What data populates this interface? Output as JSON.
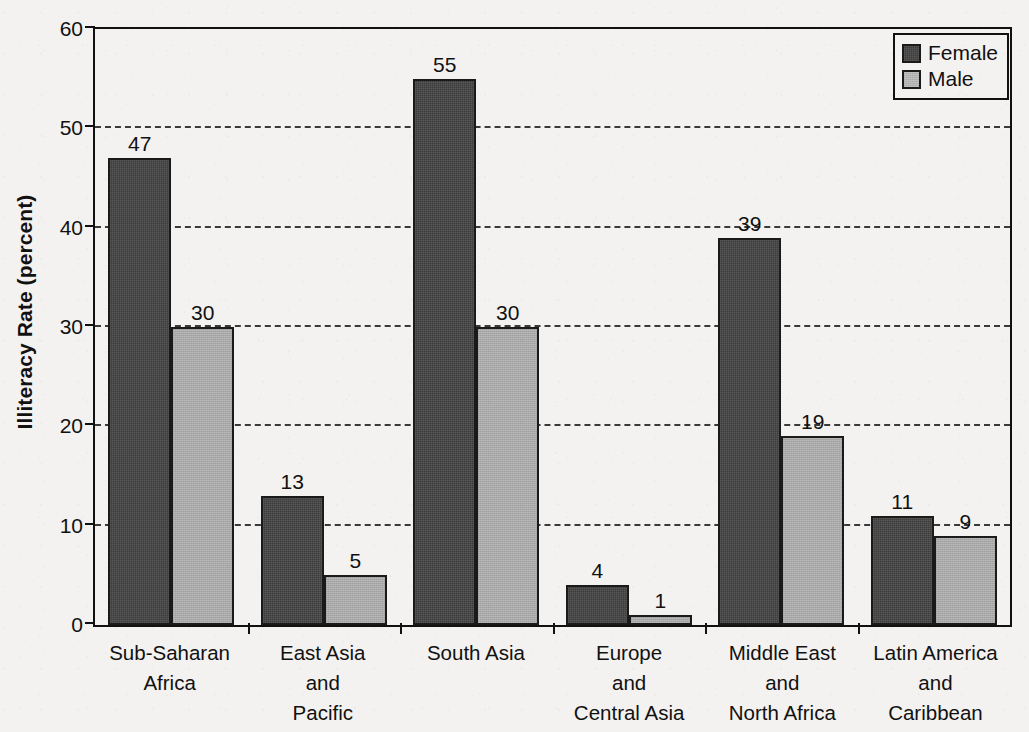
{
  "chart_data": {
    "type": "bar",
    "title": "",
    "xlabel": "",
    "ylabel": "Illiteracy Rate (percent)",
    "ylim": [
      0,
      60
    ],
    "ytick_labels": [
      "0",
      "10",
      "20",
      "30",
      "40",
      "50",
      "60"
    ],
    "yticks": [
      0,
      10,
      20,
      30,
      40,
      50,
      60
    ],
    "grid": "horizontal-dashed",
    "legend_position": "top-right",
    "categories": [
      "Sub-Saharan\nAfrica",
      "East Asia\nand\nPacific",
      "South Asia",
      "Europe\nand\nCentral Asia",
      "Middle East\nand\nNorth Africa",
      "Latin America\nand\nCaribbean"
    ],
    "category_lines": [
      [
        "Sub-Saharan",
        "Africa"
      ],
      [
        "East Asia",
        "and",
        "Pacific"
      ],
      [
        "South Asia"
      ],
      [
        "Europe",
        "and",
        "Central Asia"
      ],
      [
        "Middle East",
        "and",
        "North Africa"
      ],
      [
        "Latin America",
        "and",
        "Caribbean"
      ]
    ],
    "series": [
      {
        "name": "Female",
        "color": "#3c3c3c",
        "values": [
          47,
          13,
          55,
          4,
          39,
          11
        ]
      },
      {
        "name": "Male",
        "color": "#a9a9a9",
        "values": [
          30,
          5,
          30,
          1,
          19,
          9
        ]
      }
    ]
  },
  "legend": {
    "items": [
      {
        "label": "Female",
        "swatch": "female-swatch"
      },
      {
        "label": "Male",
        "swatch": "male-swatch"
      }
    ]
  }
}
